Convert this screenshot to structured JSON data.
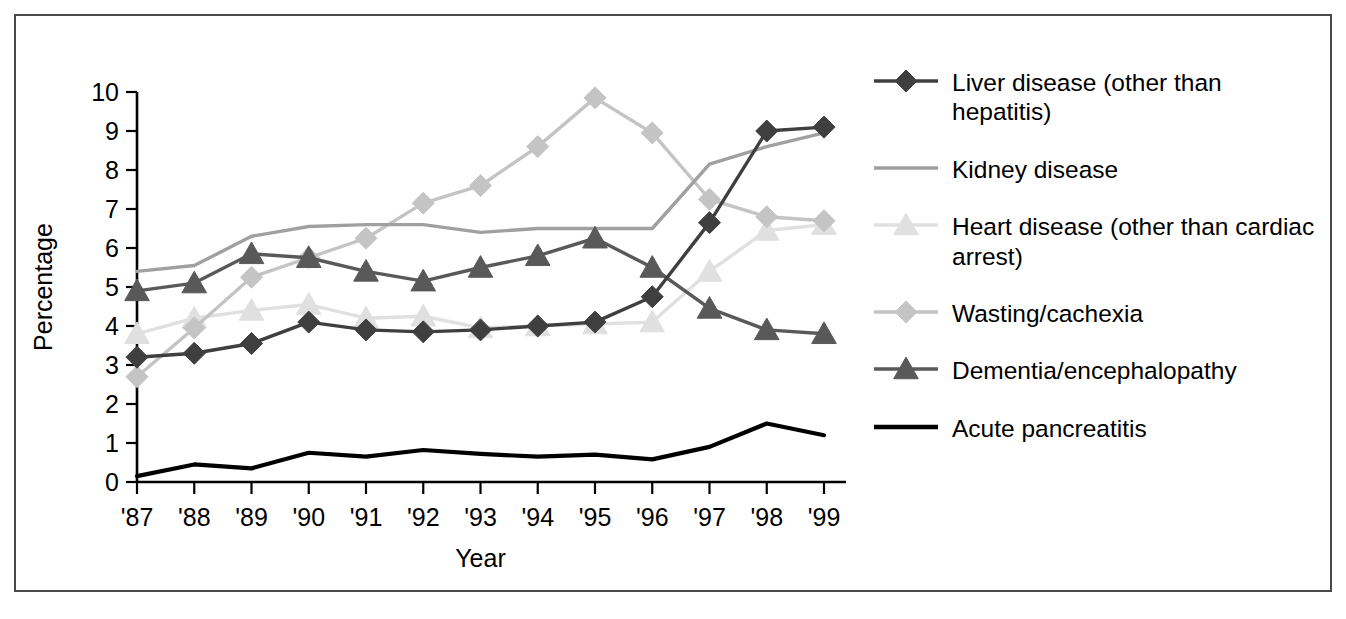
{
  "chart_data": {
    "type": "line",
    "title": "",
    "xlabel": "Year",
    "ylabel": "Percentage",
    "categories": [
      "'87",
      "'88",
      "'89",
      "'90",
      "'91",
      "'92",
      "'93",
      "'94",
      "'95",
      "'96",
      "'97",
      "'98",
      "'99"
    ],
    "ylim": [
      0,
      10
    ],
    "ytick_labels": [
      "0",
      "1",
      "2",
      "3",
      "4",
      "5",
      "6",
      "7",
      "8",
      "9",
      "10"
    ],
    "grid": false,
    "legend_position": "right",
    "series": [
      {
        "name": "Liver disease (other than hepatitis)",
        "marker": "diamond",
        "color": "#3f3f3f",
        "values": [
          3.2,
          3.3,
          3.55,
          4.1,
          3.9,
          3.85,
          3.9,
          4.0,
          4.1,
          4.75,
          6.65,
          9.0,
          9.1
        ]
      },
      {
        "name": "Kidney disease",
        "marker": "none",
        "color": "#a0a0a0",
        "values": [
          5.4,
          5.55,
          6.3,
          6.55,
          6.6,
          6.6,
          6.4,
          6.5,
          6.5,
          6.5,
          8.15,
          8.6,
          8.95
        ]
      },
      {
        "name": "Heart disease (other than cardiac arrest)",
        "marker": "triangle",
        "color": "#e0e0e0",
        "values": [
          3.8,
          4.2,
          4.4,
          4.55,
          4.2,
          4.25,
          3.95,
          4.0,
          4.05,
          4.1,
          5.4,
          6.45,
          6.6
        ]
      },
      {
        "name": "Wasting/cachexia",
        "marker": "diamond",
        "color": "#c4c4c4",
        "values": [
          2.7,
          3.95,
          5.25,
          5.75,
          6.25,
          7.15,
          7.6,
          8.6,
          9.85,
          8.95,
          7.25,
          6.8,
          6.7
        ]
      },
      {
        "name": "Dementia/encephalopathy",
        "marker": "triangle",
        "color": "#595959",
        "values": [
          4.9,
          5.1,
          5.85,
          5.75,
          5.4,
          5.15,
          5.5,
          5.8,
          6.25,
          5.5,
          4.45,
          3.9,
          3.8
        ]
      },
      {
        "name": "Acute pancreatitis",
        "marker": "none",
        "color": "#000000",
        "values": [
          0.15,
          0.45,
          0.35,
          0.75,
          0.65,
          0.82,
          0.72,
          0.65,
          0.7,
          0.58,
          0.9,
          1.5,
          1.2
        ]
      }
    ]
  }
}
